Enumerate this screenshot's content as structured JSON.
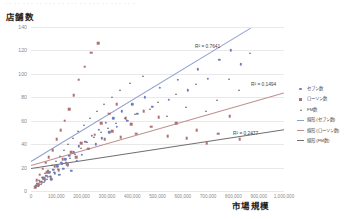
{
  "header": {
    "faint_toolbar_text": "・・・・・・・・・・・・・・・・・・・・・・・・・・・・・・"
  },
  "axis_titles": {
    "y": "店舗数",
    "x": "市場規模"
  },
  "legend": {
    "items": [
      {
        "label": "セブン数",
        "marker": "circle-marker",
        "color": "#6c80c0"
      },
      {
        "label": "ローソン数",
        "marker": "square-marker",
        "color": "#b07070"
      },
      {
        "label": "FM数",
        "marker": "triangle-marker",
        "color": "#6f6f6f"
      },
      {
        "label": "線形 (セブン数)",
        "marker": "line-marker",
        "color": "#8f9fd0"
      },
      {
        "label": "線形 (ローソン数)",
        "marker": "line-marker",
        "color": "#c09090"
      },
      {
        "label": "線形 (FM数)",
        "marker": "line-marker",
        "color": "#707070"
      }
    ]
  },
  "annotations": [
    {
      "name": "r2-seven",
      "text": "R² = 0.7641",
      "x": 195,
      "y": 44
    },
    {
      "name": "r2-lawson",
      "text": "R² = 0.1494",
      "x": 251,
      "y": 82
    },
    {
      "name": "r2-fm",
      "text": "R² = 0.2477",
      "x": 233,
      "y": 131
    }
  ],
  "chart_data": {
    "type": "scatter",
    "title": "",
    "xlabel": "市場規模",
    "ylabel": "店舗数",
    "xlim": [
      0,
      1000000
    ],
    "ylim": [
      0,
      140
    ],
    "xticks": [
      0,
      100000,
      200000,
      300000,
      400000,
      500000,
      600000,
      700000,
      800000,
      900000,
      1000000
    ],
    "xticklabels": [
      "0",
      "100,000",
      "200,000",
      "300,000",
      "400,000",
      "500,000",
      "600,000",
      "700,000",
      "800,000",
      "900,000",
      "1,000,000"
    ],
    "yticks": [
      0,
      20,
      40,
      60,
      80,
      100,
      120,
      140
    ],
    "yticklabels": [
      "0",
      "20",
      "40",
      "60",
      "80",
      "100",
      "120",
      "140"
    ],
    "grid": "horizontal",
    "legend_position": "right",
    "series": [
      {
        "name": "セブン数",
        "marker": "circle",
        "color": "#6c80c0",
        "points": [
          [
            18000,
            4
          ],
          [
            24000,
            6
          ],
          [
            30000,
            5
          ],
          [
            36000,
            8
          ],
          [
            42000,
            7
          ],
          [
            48000,
            11
          ],
          [
            54000,
            9
          ],
          [
            60000,
            13
          ],
          [
            66000,
            12
          ],
          [
            72000,
            16
          ],
          [
            80000,
            10
          ],
          [
            88000,
            18
          ],
          [
            95000,
            15
          ],
          [
            104000,
            21
          ],
          [
            112000,
            14
          ],
          [
            120000,
            24
          ],
          [
            128000,
            19
          ],
          [
            136000,
            27
          ],
          [
            145000,
            22
          ],
          [
            152000,
            30
          ],
          [
            160000,
            17
          ],
          [
            170000,
            33
          ],
          [
            180000,
            26
          ],
          [
            190000,
            38
          ],
          [
            200000,
            31
          ],
          [
            215000,
            42
          ],
          [
            228000,
            36
          ],
          [
            240000,
            47
          ],
          [
            255000,
            40
          ],
          [
            268000,
            52
          ],
          [
            280000,
            45
          ],
          [
            295000,
            58
          ],
          [
            310000,
            50
          ],
          [
            325000,
            62
          ],
          [
            340000,
            55
          ],
          [
            360000,
            68
          ],
          [
            380000,
            60
          ],
          [
            400000,
            74
          ],
          [
            420000,
            66
          ],
          [
            450000,
            80
          ],
          [
            480000,
            72
          ],
          [
            510000,
            88
          ],
          [
            545000,
            78
          ],
          [
            580000,
            95
          ],
          [
            620000,
            86
          ],
          [
            660000,
            104
          ],
          [
            700000,
            96
          ],
          [
            745000,
            112
          ],
          [
            790000,
            120
          ],
          [
            830000,
            108
          ]
        ]
      },
      {
        "name": "ローソン数",
        "marker": "square",
        "color": "#b07070",
        "points": [
          [
            16000,
            3
          ],
          [
            22000,
            9
          ],
          [
            28000,
            6
          ],
          [
            34000,
            14
          ],
          [
            40000,
            8
          ],
          [
            46000,
            19
          ],
          [
            52000,
            11
          ],
          [
            58000,
            24
          ],
          [
            64000,
            16
          ],
          [
            70000,
            29
          ],
          [
            78000,
            12
          ],
          [
            86000,
            35
          ],
          [
            94000,
            21
          ],
          [
            102000,
            44
          ],
          [
            110000,
            18
          ],
          [
            118000,
            52
          ],
          [
            126000,
            27
          ],
          [
            134000,
            60
          ],
          [
            142000,
            23
          ],
          [
            150000,
            70
          ],
          [
            158000,
            33
          ],
          [
            168000,
            82
          ],
          [
            178000,
            29
          ],
          [
            188000,
            95
          ],
          [
            198000,
            41
          ],
          [
            212000,
            106
          ],
          [
            225000,
            36
          ],
          [
            238000,
            118
          ],
          [
            252000,
            48
          ],
          [
            265000,
            126
          ],
          [
            278000,
            58
          ],
          [
            292000,
            44
          ],
          [
            308000,
            66
          ],
          [
            322000,
            51
          ],
          [
            338000,
            74
          ],
          [
            355000,
            46
          ],
          [
            375000,
            62
          ],
          [
            395000,
            57
          ],
          [
            415000,
            49
          ],
          [
            445000,
            68
          ],
          [
            475000,
            55
          ],
          [
            505000,
            63
          ],
          [
            540000,
            47
          ],
          [
            575000,
            58
          ],
          [
            615000,
            45
          ],
          [
            655000,
            52
          ],
          [
            695000,
            41
          ],
          [
            740000,
            49
          ],
          [
            785000,
            64
          ],
          [
            825000,
            44
          ]
        ]
      },
      {
        "name": "FM数",
        "marker": "triangle",
        "color": "#6f6f6f",
        "points": [
          [
            20000,
            5
          ],
          [
            26000,
            4
          ],
          [
            32000,
            9
          ],
          [
            38000,
            6
          ],
          [
            44000,
            12
          ],
          [
            50000,
            8
          ],
          [
            56000,
            15
          ],
          [
            62000,
            10
          ],
          [
            68000,
            18
          ],
          [
            75000,
            13
          ],
          [
            83000,
            22
          ],
          [
            91000,
            16
          ],
          [
            99000,
            26
          ],
          [
            107000,
            19
          ],
          [
            115000,
            30
          ],
          [
            123000,
            23
          ],
          [
            131000,
            35
          ],
          [
            139000,
            25
          ],
          [
            148000,
            40
          ],
          [
            156000,
            28
          ],
          [
            165000,
            45
          ],
          [
            175000,
            32
          ],
          [
            185000,
            51
          ],
          [
            196000,
            37
          ],
          [
            208000,
            56
          ],
          [
            222000,
            42
          ],
          [
            235000,
            62
          ],
          [
            248000,
            46
          ],
          [
            262000,
            68
          ],
          [
            275000,
            50
          ],
          [
            290000,
            74
          ],
          [
            305000,
            54
          ],
          [
            320000,
            80
          ],
          [
            335000,
            58
          ],
          [
            352000,
            86
          ],
          [
            372000,
            62
          ],
          [
            392000,
            92
          ],
          [
            412000,
            66
          ],
          [
            442000,
            98
          ],
          [
            472000,
            70
          ],
          [
            502000,
            76
          ],
          [
            537000,
            64
          ],
          [
            572000,
            83
          ],
          [
            612000,
            72
          ],
          [
            652000,
            91
          ],
          [
            692000,
            68
          ],
          [
            737000,
            78
          ],
          [
            782000,
            96
          ],
          [
            822000,
            86
          ],
          [
            865000,
            118
          ]
        ]
      }
    ],
    "trendlines": [
      {
        "name": "線形 (セブン数)",
        "color": "#8f9fd0",
        "x0": 0,
        "y0": 26,
        "x1": 870000,
        "y1": 140,
        "r2": 0.7641
      },
      {
        "name": "線形 (ローソン数)",
        "color": "#c09090",
        "x0": 0,
        "y0": 22,
        "x1": 1000000,
        "y1": 84,
        "r2": 0.1494
      },
      {
        "name": "線形 (FM数)",
        "color": "#707070",
        "x0": 0,
        "y0": 20,
        "x1": 1000000,
        "y1": 53,
        "r2": 0.2477
      }
    ]
  }
}
